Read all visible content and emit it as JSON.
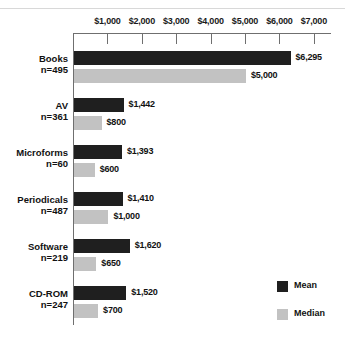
{
  "chart_data": {
    "type": "bar",
    "orientation": "horizontal",
    "title": "",
    "xlabel": "",
    "ylabel": "",
    "xlim": [
      0,
      7500
    ],
    "grid": false,
    "axis_position": "top",
    "legend_position": "bottom-right",
    "tick_labels": [
      "$1,000",
      "$2,000",
      "$3,000",
      "$4,000",
      "$5,000",
      "$6,000",
      "$7,000"
    ],
    "tick_values": [
      1000,
      2000,
      3000,
      4000,
      5000,
      6000,
      7000
    ],
    "categories": [
      "Books",
      "AV",
      "Microforms",
      "Periodicals",
      "Software",
      "CD-ROM"
    ],
    "category_counts": [
      "n=495",
      "n=361",
      "n=60",
      "n=487",
      "n=219",
      "n=247"
    ],
    "series": [
      {
        "name": "Mean",
        "color": "#1f1f1f",
        "values": [
          6295,
          1442,
          1393,
          1410,
          1620,
          1520
        ],
        "labels": [
          "$6,295",
          "$1,442",
          "$1,393",
          "$1,410",
          "$1,620",
          "$1,520"
        ]
      },
      {
        "name": "Median",
        "color": "#c2c2c2",
        "values": [
          5000,
          800,
          600,
          1000,
          650,
          700
        ],
        "labels": [
          "$5,000",
          "$800",
          "$600",
          "$1,000",
          "$650",
          "$700"
        ]
      }
    ]
  },
  "legend": {
    "items": [
      {
        "label": "Mean",
        "color": "#1f1f1f"
      },
      {
        "label": "Median",
        "color": "#c2c2c2"
      }
    ]
  }
}
